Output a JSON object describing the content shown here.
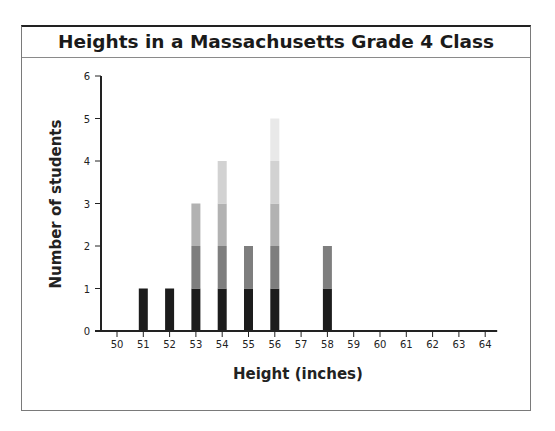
{
  "chart_data": {
    "type": "bar",
    "subtype": "stacked-dot-plot",
    "title": "Heights in a Massachusetts Grade 4 Class",
    "xlabel": "Height (inches)",
    "ylabel": "Number of students",
    "categories": [
      "50",
      "51",
      "52",
      "53",
      "54",
      "55",
      "56",
      "57",
      "58",
      "59",
      "60",
      "61",
      "62",
      "63",
      "64"
    ],
    "values": [
      0,
      1,
      1,
      3,
      4,
      2,
      5,
      0,
      2,
      0,
      0,
      0,
      0,
      0,
      0
    ],
    "y_ticks": [
      0,
      1,
      2,
      3,
      4,
      5,
      6
    ],
    "ylim": [
      0,
      6
    ],
    "grid": false,
    "legend": null,
    "stack_colors": [
      "#1c1c1c",
      "#7e7e7e",
      "#b2b2b2",
      "#d2d2d2",
      "#e9e9e9"
    ]
  }
}
